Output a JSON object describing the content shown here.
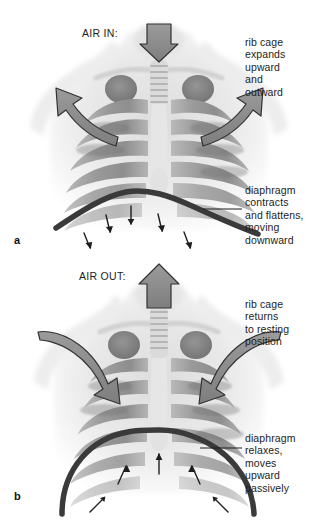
{
  "figure": {
    "background_color": "#ffffff",
    "text_color": "#1d1d1d",
    "arrow_fill": "#8c8c8c",
    "arrow_stroke": "#2b2b2b",
    "diaphragm_color": "#3a3a3a"
  },
  "panels": [
    {
      "id": "a",
      "letter": "a",
      "phase_label": "AIR IN:",
      "callouts": [
        {
          "name": "rib-cage",
          "text": "rib cage\nexpands\nupward\nand\noutward"
        },
        {
          "name": "diaphragm",
          "text": "diaphragm\ncontracts\nand flattens,\nmoving\ndownward"
        }
      ]
    },
    {
      "id": "b",
      "letter": "b",
      "phase_label": "AIR OUT:",
      "callouts": [
        {
          "name": "rib-cage",
          "text": "rib cage\nreturns\nto resting\nposition"
        },
        {
          "name": "diaphragm",
          "text": "diaphragm\nrelaxes,\nmoves\nupward\npassively"
        }
      ]
    }
  ],
  "icons": {
    "air_in_arrow": "down-arrow-icon",
    "air_out_arrow": "up-arrow-icon",
    "rib_expand_arrow": "curved-arrow-outward-icon",
    "rib_relax_arrow": "curved-arrow-inward-icon",
    "diaphragm_motion_arrow": "small-arrow-icon"
  }
}
